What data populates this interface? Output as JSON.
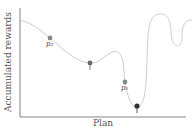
{
  "diagram": {
    "xlabel": "Plan",
    "ylabel": "Accumulated rewards",
    "curve_color": "#c8c8c8",
    "axis_color": "#666666",
    "points": [
      {
        "label": "p₂",
        "x": 50,
        "y": 38,
        "color": "#888888"
      },
      {
        "label": "†",
        "x": 90,
        "y": 63,
        "color": "#666666"
      },
      {
        "label": "p₁",
        "x": 125,
        "y": 82,
        "color": "#888888"
      },
      {
        "label": "‡",
        "x": 137,
        "y": 106,
        "color": "#333333"
      }
    ]
  }
}
